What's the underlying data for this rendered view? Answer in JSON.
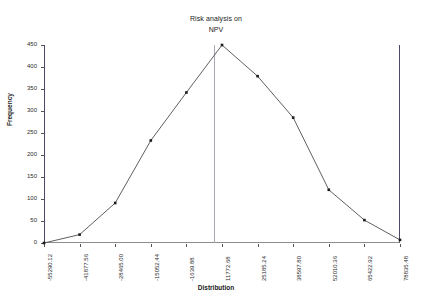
{
  "chart_data": {
    "type": "line",
    "title": "Risk analysis on NPV",
    "title_lines": [
      "Risk analysis on",
      "NPV"
    ],
    "xlabel": "Distribution",
    "ylabel": "Frequency",
    "categories": [
      "-55290.12",
      "-41877.56",
      "-28465.00",
      "-15052.44",
      "-1639.88",
      "11772.68",
      "25185.24",
      "38597.80",
      "52010.36",
      "65422.92",
      "78835.48"
    ],
    "values": [
      0,
      19,
      91,
      233,
      342,
      450,
      379,
      285,
      121,
      52,
      7
    ],
    "ylim": [
      0,
      450
    ],
    "yticks": [
      0,
      50,
      100,
      150,
      200,
      250,
      300,
      350,
      400,
      450
    ],
    "ytick_labels": [
      "0",
      "50",
      "100",
      "150",
      "200",
      "250",
      "300",
      "350",
      "400",
      "450"
    ],
    "grid": false,
    "legend": false,
    "marker": "square",
    "line_color": "#4d4d4d",
    "marker_color": "#1a1a1a",
    "reference_line": {
      "name": "mean-marker",
      "x_value": "11772.68",
      "color": "#a9a9b4"
    },
    "series": [
      {
        "name": "Frequency",
        "values": [
          0,
          19,
          91,
          233,
          342,
          450,
          379,
          285,
          121,
          52,
          7
        ]
      }
    ],
    "points": [
      {
        "x": "-55290.12",
        "y": 0
      },
      {
        "x": "-41877.56",
        "y": 19
      },
      {
        "x": "-28465.00",
        "y": 91
      },
      {
        "x": "-15052.44",
        "y": 233
      },
      {
        "x": "-1639.88",
        "y": 342
      },
      {
        "x": "11772.68",
        "y": 450
      },
      {
        "x": "25185.24",
        "y": 379
      },
      {
        "x": "38597.80",
        "y": 285
      },
      {
        "x": "52010.36",
        "y": 121
      },
      {
        "x": "65422.92",
        "y": 52
      },
      {
        "x": "78835.48",
        "y": 7
      }
    ]
  }
}
